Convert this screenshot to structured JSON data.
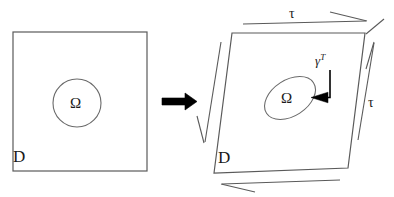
{
  "figure": {
    "colors": {
      "stroke": "#4d4d4d",
      "arrow_fill": "#000000",
      "text": "#1a1a1a",
      "background": "#ffffff"
    }
  },
  "reference_domain": {
    "domain_label": "D",
    "subdomain_label": "Ω",
    "shape": "square",
    "subdomain_shape": "circle"
  },
  "transform_arrow": {
    "icon": "right-arrow-icon",
    "direction": "right"
  },
  "deformed_domain": {
    "domain_label": "D",
    "subdomain_label": "Ω",
    "shape": "sheared-quadrilateral",
    "subdomain_shape": "ellipse",
    "map_label": "γ",
    "map_superscript": "T"
  },
  "traction_arrows": {
    "top_label": "τ",
    "right_label": "τ",
    "top_direction": "right",
    "right_direction": "up",
    "left_direction": "down",
    "bottom_direction": "left"
  }
}
